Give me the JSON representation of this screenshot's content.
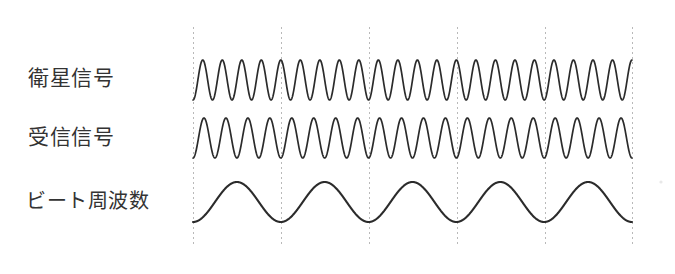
{
  "figure": {
    "title": "",
    "background_color": "#ffffff",
    "line_color": "#2b2b2b",
    "gridline_color": "#b9b9b9",
    "text_color": "#333333"
  },
  "labels": {
    "satellite_signal": "衛星信号",
    "received_signal": "受信信号",
    "beat_frequency": "ビート周波数"
  },
  "chart_data": {
    "type": "line",
    "title": "",
    "xlabel": "",
    "ylabel": "",
    "grid": true,
    "legend_position": "left-row-labels",
    "x_range": [
      193,
      632
    ],
    "gridlines_x": [
      193,
      281,
      369,
      457,
      545,
      632
    ],
    "gridline_y_range": [
      27,
      245
    ],
    "series": [
      {
        "name": "衛星信号",
        "label": "satellite-signal",
        "waveform": "sine",
        "cycles_total": 22.5,
        "cycles_per_division": 4.5,
        "baseline_y": 80,
        "amplitude": 20,
        "phase_deg": 180,
        "color": "#2b2b2b"
      },
      {
        "name": "受信信号",
        "label": "received-signal",
        "waveform": "sine",
        "cycles_total": 20,
        "cycles_per_division": 4.0,
        "baseline_y": 138,
        "amplitude": 20,
        "phase_deg": 180,
        "color": "#2b2b2b"
      },
      {
        "name": "ビート周波数",
        "label": "beat-frequency",
        "waveform": "sine",
        "cycles_total": 5,
        "cycles_per_division": 1.0,
        "baseline_y": 202,
        "amplitude": 20,
        "phase_deg": 180,
        "color": "#2b2b2b"
      }
    ]
  }
}
